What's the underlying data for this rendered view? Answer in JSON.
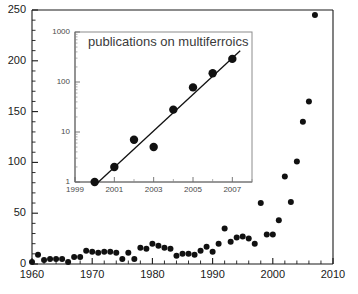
{
  "chart_data": [
    {
      "id": "main",
      "type": "scatter",
      "title": "",
      "xlabel": "",
      "ylabel": "",
      "xlim": [
        1960,
        2010
      ],
      "ylim": [
        0,
        250
      ],
      "grid": false,
      "legend": "none",
      "x_major_ticks": [
        1960,
        1970,
        1980,
        1990,
        2000,
        2010
      ],
      "x_tick_labels": [
        "1960",
        "1970",
        "1980",
        "1990",
        "2000",
        "2010"
      ],
      "x_minor_step": 2,
      "y_major_ticks": [
        0,
        50,
        100,
        150,
        200,
        250
      ],
      "y_tick_labels": [
        "0",
        "50",
        "100",
        "150",
        "200",
        "250"
      ],
      "y_minor_step": 10,
      "marker": "filled-circle",
      "marker_color": "#111111",
      "x": [
        1960,
        1961,
        1962,
        1963,
        1964,
        1965,
        1966,
        1967,
        1968,
        1969,
        1970,
        1971,
        1972,
        1973,
        1974,
        1975,
        1976,
        1977,
        1978,
        1979,
        1980,
        1981,
        1982,
        1983,
        1984,
        1985,
        1986,
        1987,
        1988,
        1989,
        1990,
        1991,
        1992,
        1993,
        1994,
        1995,
        1996,
        1997,
        1998,
        1999,
        2000,
        2001,
        2002,
        2003,
        2004,
        2005,
        2006,
        2007
      ],
      "y": [
        2,
        9,
        4,
        5,
        5,
        5,
        2,
        7,
        7,
        13,
        12,
        11,
        12,
        12,
        11,
        5,
        11,
        5,
        16,
        15,
        20,
        18,
        16,
        15,
        8,
        10,
        10,
        9,
        13,
        17,
        12,
        20,
        35,
        22,
        26,
        27,
        25,
        20,
        60,
        29,
        29,
        43,
        86,
        61,
        101,
        140,
        160,
        245
      ]
    },
    {
      "id": "inset",
      "type": "scatter",
      "title": "publications on multiferroics",
      "xlabel": "",
      "ylabel": "",
      "yscale": "log",
      "xlim": [
        1999,
        2008
      ],
      "ylim": [
        1,
        1000
      ],
      "grid": false,
      "legend": "none",
      "x_major_ticks": [
        1999,
        2001,
        2003,
        2005,
        2007
      ],
      "x_tick_labels": [
        "1999",
        "2001",
        "2003",
        "2005",
        "2007"
      ],
      "x_minor_step": 1,
      "y_major_ticks": [
        1,
        10,
        100,
        1000
      ],
      "y_tick_labels": [
        "1",
        "10",
        "100",
        "1000"
      ],
      "marker": "filled-circle",
      "marker_color": "#111111",
      "x": [
        2000,
        2001,
        2002,
        2003,
        2004,
        2005,
        2006,
        2007
      ],
      "y": [
        1,
        2,
        7,
        5,
        28,
        78,
        150,
        290
      ],
      "fit_line": {
        "x": [
          2000,
          2007.4
        ],
        "y": [
          0.85,
          420
        ],
        "style": "solid",
        "color": "#111111"
      }
    }
  ]
}
